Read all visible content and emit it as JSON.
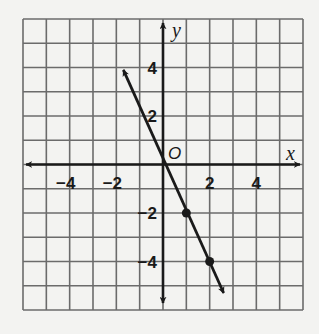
{
  "chart_data": {
    "type": "line",
    "title": "",
    "xlabel": "x",
    "ylabel": "y",
    "origin_label": "O",
    "xlim": [
      -6,
      6
    ],
    "ylim": [
      -6,
      6
    ],
    "grid": true,
    "grid_step": 1,
    "x_ticks": [
      {
        "value": -4,
        "label": "−4"
      },
      {
        "value": -2,
        "label": "−2"
      },
      {
        "value": 2,
        "label": "2"
      },
      {
        "value": 4,
        "label": "4"
      }
    ],
    "y_ticks": [
      {
        "value": 4,
        "label": "4"
      },
      {
        "value": 2,
        "label": "2"
      },
      {
        "value": -2,
        "label": "−2"
      },
      {
        "value": -4,
        "label": "−4"
      }
    ],
    "series": [
      {
        "name": "line",
        "equation": "y = -2x",
        "slope": -2,
        "intercept": 0,
        "arrow_start": [
          -1.7,
          3.9
        ],
        "arrow_end": [
          2.6,
          -5.3
        ],
        "marked_points": [
          [
            1,
            -2
          ],
          [
            2,
            -4
          ]
        ]
      }
    ],
    "colors": {
      "grid": "#6b6b6b",
      "axes": "#1a1a1a",
      "line": "#1a1a1a",
      "background": "#f3f3f1"
    }
  }
}
